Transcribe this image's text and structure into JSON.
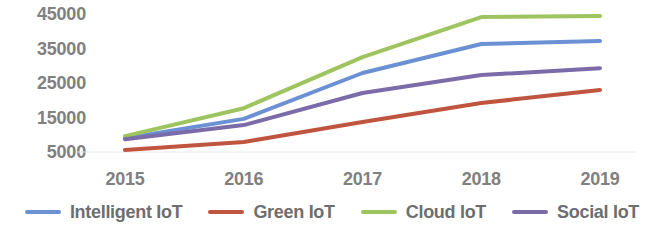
{
  "chart_data": {
    "type": "line",
    "title": "",
    "subtitle": "",
    "xlabel": "",
    "ylabel": "",
    "categories": [
      "2015",
      "2016",
      "2017",
      "2018",
      "2019"
    ],
    "ylim": [
      0,
      45000
    ],
    "ytick_values": [
      45000,
      35000,
      25000,
      15000,
      5000
    ],
    "ytick_labels": [
      "45000",
      "35000",
      "25000",
      "15000",
      "5000"
    ],
    "grid": false,
    "legend_position": "bottom",
    "series": [
      {
        "name": "Intelligent IoT",
        "color": "#6C90D4",
        "values": [
          9000,
          14600,
          27900,
          36300,
          37200
        ]
      },
      {
        "name": "Green IoT",
        "color": "#C0553F",
        "values": [
          5600,
          7900,
          13700,
          19200,
          23000
        ]
      },
      {
        "name": "Cloud IoT",
        "color": "#9DC45F",
        "values": [
          9600,
          17700,
          32500,
          44100,
          44400
        ]
      },
      {
        "name": "Social IoT",
        "color": "#7B6BA8",
        "values": [
          8700,
          12800,
          22100,
          27300,
          29300
        ]
      }
    ]
  },
  "legend": {
    "items": [
      {
        "label": "Intelligent IoT",
        "color": "#6C90D4"
      },
      {
        "label": "Green IoT",
        "color": "#C0553F"
      },
      {
        "label": "Cloud IoT",
        "color": "#9DC45F"
      },
      {
        "label": "Social IoT",
        "color": "#7B6BA8"
      }
    ]
  },
  "axes": {
    "y_labels": [
      "45000",
      "35000",
      "25000",
      "15000",
      "5000"
    ],
    "x_labels": [
      "2015",
      "2016",
      "2017",
      "2018",
      "2019"
    ]
  },
  "colors": {
    "tick_text": "#808080",
    "legend_text": "#6e6e6e",
    "gridline": "#e8e8e8",
    "background": "#ffffff"
  }
}
